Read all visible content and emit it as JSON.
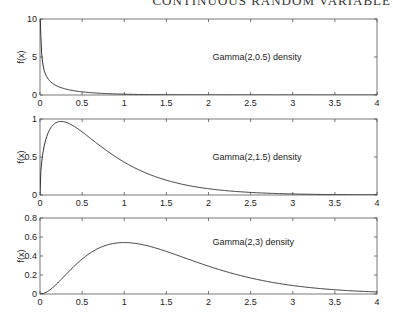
{
  "header": {
    "text": "CONTINUOUS RANDOM VARIABLE"
  },
  "chart_data": [
    {
      "type": "line",
      "title": "",
      "annotation": "Gamma(2,0.5) density",
      "xlabel": "",
      "ylabel": "f(x)",
      "xlim": [
        0,
        4
      ],
      "ylim": [
        0,
        10
      ],
      "xticks": [
        "0",
        "0.5",
        "1",
        "1.5",
        "2",
        "2.5",
        "3",
        "3.5",
        "4"
      ],
      "yticks": [
        "0",
        "5",
        "10"
      ],
      "grid": false,
      "shape": 0.5,
      "rate": 2,
      "x": [
        0.01,
        0.05,
        0.1,
        0.2,
        0.3,
        0.5,
        0.75,
        1,
        1.5,
        2,
        3,
        4
      ],
      "values": [
        7.9,
        3.41,
        2.3,
        1.44,
        1.07,
        0.64,
        0.36,
        0.22,
        0.08,
        0.03,
        0.004,
        0.0006
      ]
    },
    {
      "type": "line",
      "title": "",
      "annotation": "Gamma(2,1.5) density",
      "xlabel": "",
      "ylabel": "f(x)",
      "xlim": [
        0,
        4
      ],
      "ylim": [
        0,
        1
      ],
      "xticks": [
        "0",
        "0.5",
        "1",
        "1.5",
        "2",
        "2.5",
        "3",
        "3.5",
        "4"
      ],
      "yticks": [
        "0",
        "0.5",
        "1"
      ],
      "grid": false,
      "shape": 1.5,
      "rate": 2,
      "x": [
        0,
        0.1,
        0.25,
        0.5,
        0.75,
        1,
        1.5,
        2,
        2.5,
        3,
        3.5,
        4
      ],
      "values": [
        0,
        0.83,
        0.97,
        0.83,
        0.6,
        0.43,
        0.17,
        0.06,
        0.02,
        0.01,
        0.002,
        0.001
      ]
    },
    {
      "type": "line",
      "title": "",
      "annotation": "Gamma(2,3) density",
      "xlabel": "",
      "ylabel": "f(x)",
      "xlim": [
        0,
        4
      ],
      "ylim": [
        0,
        0.8
      ],
      "xticks": [
        "0",
        "0.5",
        "1",
        "1.5",
        "2",
        "2.5",
        "3",
        "3.5",
        "4"
      ],
      "yticks": [
        "0",
        "0.2",
        "0.4",
        "0.6",
        "0.8"
      ],
      "grid": false,
      "shape": 3,
      "rate": 2,
      "x": [
        0,
        0.25,
        0.5,
        0.75,
        1,
        1.5,
        2,
        2.5,
        3,
        3.5,
        4
      ],
      "values": [
        0,
        0.15,
        0.37,
        0.5,
        0.54,
        0.45,
        0.29,
        0.17,
        0.09,
        0.04,
        0.02
      ]
    }
  ]
}
